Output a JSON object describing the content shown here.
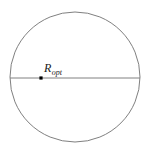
{
  "figure": {
    "background_color": "#ffffff",
    "stroke_color": "#808080",
    "marker_color": "#000000",
    "label_color": "#1a1a1a",
    "circle": {
      "center_x": 75,
      "center_y": 77,
      "radius": 65,
      "stroke_width": 1
    },
    "diameter_line": {
      "x1": 10,
      "y1": 78,
      "x2": 140,
      "y2": 78,
      "stroke_width": 1
    },
    "marker": {
      "name": "optimal-radius-point",
      "x": 41,
      "y": 78,
      "size": 3.2
    },
    "label": {
      "base": "R",
      "subscript": "opt",
      "x": 44,
      "y": 72,
      "font_size": 12,
      "subscript_font_size": 8
    }
  }
}
